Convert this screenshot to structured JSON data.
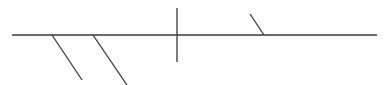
{
  "diagram": {
    "canvas": {
      "width": 388,
      "height": 85,
      "background": "#fdfdfd"
    },
    "stroke_color": "#3a3a3a",
    "stroke_width": 1.3,
    "lines": [
      {
        "id": "spine",
        "name": "main-horizontal-line",
        "x1": 12,
        "y1": 35,
        "x2": 377,
        "y2": 35
      },
      {
        "id": "branch-1",
        "name": "lower-diagonal-branch-1",
        "x1": 52,
        "y1": 35,
        "x2": 82,
        "y2": 80
      },
      {
        "id": "branch-2",
        "name": "lower-diagonal-branch-2",
        "x1": 93,
        "y1": 35,
        "x2": 127,
        "y2": 85
      },
      {
        "id": "vertical",
        "name": "vertical-crossing-line",
        "x1": 177,
        "y1": 8,
        "x2": 177,
        "y2": 62
      },
      {
        "id": "branch-3",
        "name": "upper-diagonal-branch",
        "x1": 250,
        "y1": 14,
        "x2": 264,
        "y2": 35
      }
    ]
  }
}
